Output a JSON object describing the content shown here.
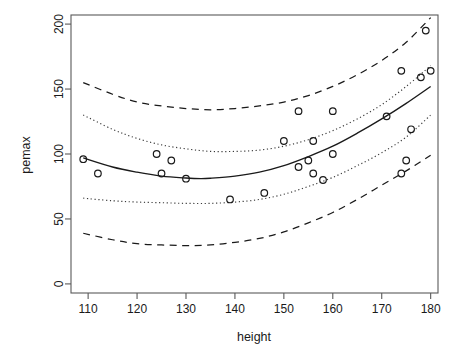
{
  "chart_data": {
    "type": "scatter",
    "title": "",
    "subtitle": "",
    "xlabel": "height",
    "ylabel": "pemax",
    "xlim": [
      106.5,
      181.5
    ],
    "ylim": [
      -7,
      207
    ],
    "xticks": [
      110,
      120,
      130,
      140,
      150,
      160,
      170,
      180
    ],
    "xticklabels": [
      "110",
      "120",
      "130",
      "140",
      "150",
      "160",
      "170",
      "180"
    ],
    "yticks": [
      0,
      50,
      100,
      150,
      200
    ],
    "yticklabels": [
      "0",
      "50",
      "100",
      "150",
      "200"
    ],
    "grid": false,
    "legend": "none",
    "points": [
      {
        "x": 109,
        "y": 96
      },
      {
        "x": 112,
        "y": 85
      },
      {
        "x": 124,
        "y": 100
      },
      {
        "x": 125,
        "y": 85
      },
      {
        "x": 127,
        "y": 95
      },
      {
        "x": 130,
        "y": 81
      },
      {
        "x": 139,
        "y": 65
      },
      {
        "x": 146,
        "y": 70
      },
      {
        "x": 150,
        "y": 110
      },
      {
        "x": 153,
        "y": 133
      },
      {
        "x": 153,
        "y": 90
      },
      {
        "x": 155,
        "y": 95
      },
      {
        "x": 156,
        "y": 110
      },
      {
        "x": 156,
        "y": 85
      },
      {
        "x": 158,
        "y": 80
      },
      {
        "x": 160,
        "y": 133
      },
      {
        "x": 160,
        "y": 100
      },
      {
        "x": 171,
        "y": 129
      },
      {
        "x": 174,
        "y": 164
      },
      {
        "x": 174,
        "y": 85
      },
      {
        "x": 175,
        "y": 95
      },
      {
        "x": 176,
        "y": 119
      },
      {
        "x": 178,
        "y": 159
      },
      {
        "x": 179,
        "y": 195
      },
      {
        "x": 180,
        "y": 164
      }
    ],
    "series": [
      {
        "name": "quadratic fit",
        "style": "solid",
        "points": [
          {
            "x": 109,
            "y": 97
          },
          {
            "x": 115,
            "y": 90
          },
          {
            "x": 120,
            "y": 86
          },
          {
            "x": 125,
            "y": 83
          },
          {
            "x": 130,
            "y": 81.5
          },
          {
            "x": 133,
            "y": 81
          },
          {
            "x": 135,
            "y": 81.3
          },
          {
            "x": 140,
            "y": 83
          },
          {
            "x": 145,
            "y": 86
          },
          {
            "x": 150,
            "y": 91
          },
          {
            "x": 155,
            "y": 98
          },
          {
            "x": 160,
            "y": 106
          },
          {
            "x": 165,
            "y": 116
          },
          {
            "x": 170,
            "y": 127
          },
          {
            "x": 175,
            "y": 139
          },
          {
            "x": 180,
            "y": 152
          }
        ]
      },
      {
        "name": "confidence band upper",
        "style": "dotted",
        "points": [
          {
            "x": 109,
            "y": 130
          },
          {
            "x": 115,
            "y": 119
          },
          {
            "x": 120,
            "y": 112
          },
          {
            "x": 125,
            "y": 107
          },
          {
            "x": 130,
            "y": 104
          },
          {
            "x": 135,
            "y": 102
          },
          {
            "x": 140,
            "y": 102
          },
          {
            "x": 145,
            "y": 103
          },
          {
            "x": 150,
            "y": 106
          },
          {
            "x": 155,
            "y": 111
          },
          {
            "x": 160,
            "y": 118
          },
          {
            "x": 165,
            "y": 127
          },
          {
            "x": 170,
            "y": 138
          },
          {
            "x": 175,
            "y": 152
          },
          {
            "x": 180,
            "y": 168
          }
        ]
      },
      {
        "name": "confidence band lower",
        "style": "dotted",
        "points": [
          {
            "x": 109,
            "y": 66
          },
          {
            "x": 115,
            "y": 64
          },
          {
            "x": 120,
            "y": 63
          },
          {
            "x": 125,
            "y": 62.5
          },
          {
            "x": 130,
            "y": 62
          },
          {
            "x": 135,
            "y": 62
          },
          {
            "x": 140,
            "y": 63
          },
          {
            "x": 145,
            "y": 65
          },
          {
            "x": 150,
            "y": 69
          },
          {
            "x": 155,
            "y": 75
          },
          {
            "x": 160,
            "y": 82
          },
          {
            "x": 165,
            "y": 91
          },
          {
            "x": 170,
            "y": 101
          },
          {
            "x": 175,
            "y": 113
          },
          {
            "x": 180,
            "y": 130
          }
        ]
      },
      {
        "name": "prediction band upper",
        "style": "dashed",
        "points": [
          {
            "x": 109,
            "y": 155
          },
          {
            "x": 115,
            "y": 146
          },
          {
            "x": 120,
            "y": 140
          },
          {
            "x": 125,
            "y": 137
          },
          {
            "x": 130,
            "y": 135
          },
          {
            "x": 135,
            "y": 134
          },
          {
            "x": 140,
            "y": 135
          },
          {
            "x": 145,
            "y": 137
          },
          {
            "x": 150,
            "y": 140
          },
          {
            "x": 155,
            "y": 145
          },
          {
            "x": 160,
            "y": 152
          },
          {
            "x": 165,
            "y": 161
          },
          {
            "x": 170,
            "y": 172
          },
          {
            "x": 175,
            "y": 186
          },
          {
            "x": 180,
            "y": 205
          }
        ]
      },
      {
        "name": "prediction band lower",
        "style": "dashed",
        "points": [
          {
            "x": 109,
            "y": 39
          },
          {
            "x": 115,
            "y": 34
          },
          {
            "x": 120,
            "y": 31
          },
          {
            "x": 125,
            "y": 30
          },
          {
            "x": 130,
            "y": 29.5
          },
          {
            "x": 135,
            "y": 30
          },
          {
            "x": 140,
            "y": 32
          },
          {
            "x": 145,
            "y": 35
          },
          {
            "x": 150,
            "y": 40
          },
          {
            "x": 155,
            "y": 47
          },
          {
            "x": 160,
            "y": 55
          },
          {
            "x": 165,
            "y": 65
          },
          {
            "x": 170,
            "y": 76
          },
          {
            "x": 175,
            "y": 87
          },
          {
            "x": 180,
            "y": 99
          }
        ]
      }
    ]
  }
}
